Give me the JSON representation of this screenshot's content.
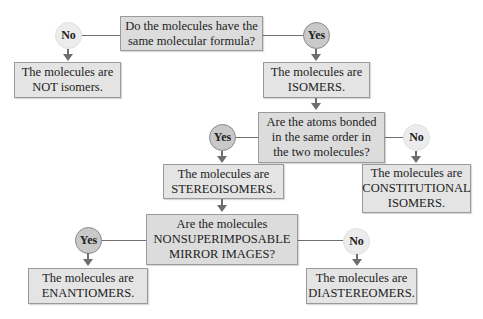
{
  "questions": [
    {
      "id": "q1",
      "text": "Do the molecules have the\nsame molecular formula?"
    },
    {
      "id": "q2",
      "text": "Are the atoms bonded\nin the same order in\nthe two molecules?"
    },
    {
      "id": "q3",
      "text": "Are the molecules\nNONSUPERIMPOSABLE\nMIRROR IMAGES?"
    }
  ],
  "answers": {
    "yes": "Yes",
    "no": "No"
  },
  "results": {
    "not_isomers": "The molecules are\nNOT isomers.",
    "isomers": "The molecules are\nISOMERS.",
    "stereoisomers": "The molecules are\nSTEREOISOMERS.",
    "constitutional": "The molecules are\nCONSTITUTIONAL\nISOMERS.",
    "enantiomers": "The molecules are\nENANTIOMERS.",
    "diastereomers": "The molecules are\nDIASTEREOMERS."
  },
  "colors": {
    "box_fill": "#e4e4e4",
    "box_border": "#9a9a9a",
    "yes_fill": "#c9c9c9",
    "no_fill": "#ececec",
    "connector": "#6e6e6e"
  }
}
